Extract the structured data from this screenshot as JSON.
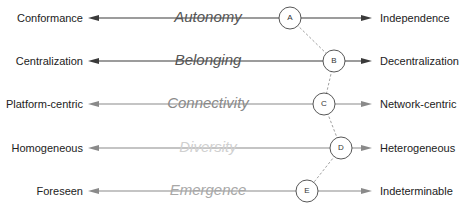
{
  "diagram": {
    "rows": [
      {
        "left": "Conformance",
        "center": "Autonomy",
        "right": "Independence",
        "node": "A",
        "y": 18,
        "node_x": 290,
        "line_color": "#3a3a3a",
        "center_color": "#555555"
      },
      {
        "left": "Centralization",
        "center": "Belonging",
        "right": "Decentralization",
        "node": "B",
        "y": 61,
        "node_x": 334,
        "line_color": "#3a3a3a",
        "center_color": "#555555"
      },
      {
        "left": "Platform-centric",
        "center": "Connectivity",
        "right": "Network-centric",
        "node": "C",
        "y": 104,
        "node_x": 324,
        "line_color": "#8a8a8a",
        "center_color": "#8a8a8a"
      },
      {
        "left": "Homogeneous",
        "center": "Diversity",
        "right": "Heterogeneous",
        "node": "D",
        "y": 148,
        "node_x": 341,
        "line_color": "#8a8a8a",
        "center_color": "#d0d0d0"
      },
      {
        "left": "Foreseen",
        "center": "Emergence",
        "right": "Indeterminable",
        "node": "E",
        "y": 191,
        "node_x": 307,
        "line_color": "#8a8a8a",
        "center_color": "#a8a8a8"
      }
    ],
    "connector": {
      "style": "dashed",
      "color": "#888888"
    },
    "axis": {
      "left_arrow_x": 88,
      "right_arrow_x": 372,
      "center_label_x": 208
    }
  }
}
